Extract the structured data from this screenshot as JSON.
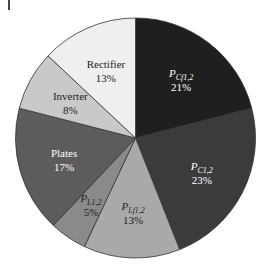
{
  "chart_data": {
    "type": "pie",
    "title": "",
    "start_angle_deg": 0,
    "direction": "clockwise",
    "legend": "none (labels inside slices)",
    "slices": [
      {
        "label": "P",
        "subscript": "Cf1,2",
        "value": 21,
        "pct_text": "21%",
        "color": "#1f1f1f",
        "text_color": "#ffffff",
        "italic": true
      },
      {
        "label": "P",
        "subscript": "C1,2",
        "value": 23,
        "pct_text": "23%",
        "color": "#3b3b3b",
        "text_color": "#ffffff",
        "italic": true
      },
      {
        "label": "P",
        "subscript": "Lf1,2",
        "value": 13,
        "pct_text": "13%",
        "color": "#a9a9a9",
        "text_color": "#222222",
        "italic": true
      },
      {
        "label": "P",
        "subscript": "L1,2",
        "value": 5,
        "pct_text": "5%",
        "color": "#8a8a8a",
        "text_color": "#222222",
        "italic": true
      },
      {
        "label": "Plates",
        "subscript": "",
        "value": 17,
        "pct_text": "17%",
        "color": "#5c5c5c",
        "text_color": "#ffffff",
        "italic": false
      },
      {
        "label": "Inverter",
        "subscript": "",
        "value": 8,
        "pct_text": "8%",
        "color": "#c9c9c9",
        "text_color": "#222222",
        "italic": false
      },
      {
        "label": "Rectifier",
        "subscript": "",
        "value": 13,
        "pct_text": "13%",
        "color": "#efefef",
        "text_color": "#222222",
        "italic": false
      }
    ]
  }
}
